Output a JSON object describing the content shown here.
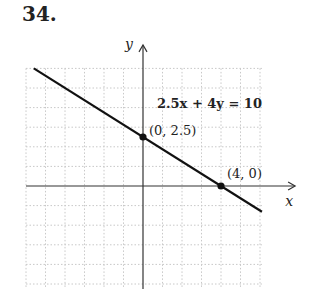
{
  "problem_number": "34.",
  "chart_data": {
    "type": "line",
    "title": "",
    "equation": "2.5x + 4y = 10",
    "xlabel": "x",
    "ylabel": "y",
    "xlim": [
      -6.1,
      6.1
    ],
    "ylim": [
      -5.2,
      6.0
    ],
    "grid": true,
    "grid_step": 1,
    "series": [
      {
        "name": "2.5x + 4y = 10",
        "x": [
          -5.6,
          6.1
        ],
        "y": [
          6.0,
          -1.3125
        ]
      }
    ],
    "points": [
      {
        "x": 0,
        "y": 2.5,
        "label": "(0, 2.5)"
      },
      {
        "x": 4,
        "y": 0,
        "label": "(4, 0)"
      }
    ]
  }
}
